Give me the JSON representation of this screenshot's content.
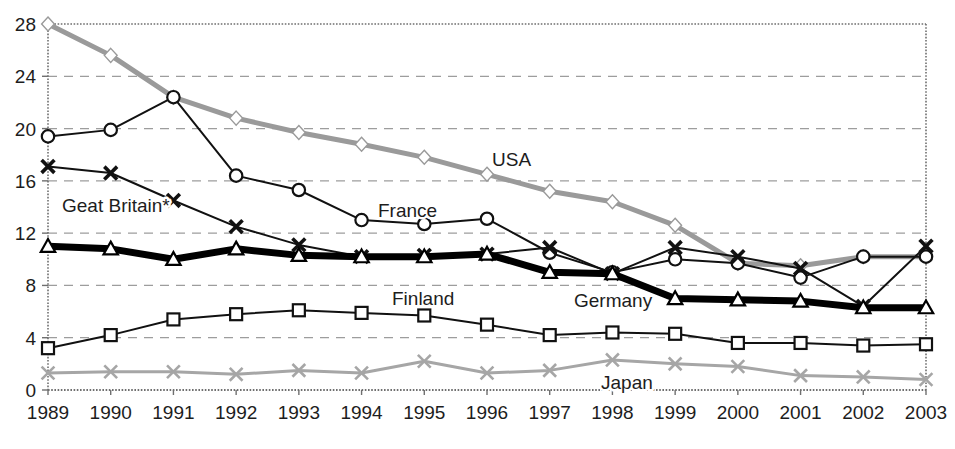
{
  "chart_data": {
    "type": "line",
    "title": "",
    "subtitle": "",
    "xlabel": "",
    "ylabel": "",
    "x": [
      1989,
      1990,
      1991,
      1992,
      1993,
      1994,
      1995,
      1996,
      1997,
      1998,
      1999,
      2000,
      2001,
      2002,
      2003
    ],
    "xtick_labels": [
      "1989",
      "1990",
      "1991",
      "1992",
      "1993",
      "1994",
      "1995",
      "1996",
      "1997",
      "1998",
      "1999",
      "2000",
      "2001",
      "2002",
      "2003"
    ],
    "ytick_labels": [
      "0",
      "4",
      "8",
      "12",
      "16",
      "20",
      "24",
      "28"
    ],
    "yticks": [
      0,
      4,
      8,
      12,
      16,
      20,
      24,
      28
    ],
    "ylim": [
      0,
      28
    ],
    "xlim": [
      1989,
      2003
    ],
    "grid": "horizontal-dashed",
    "legend_position": "inline-annotations",
    "series": [
      {
        "name": "USA",
        "label": "USA",
        "marker": "diamond",
        "color": "#9a9a9a",
        "line_width": 5,
        "style": "thick-grey",
        "values": [
          28.0,
          25.6,
          22.4,
          20.8,
          19.7,
          18.8,
          17.8,
          16.5,
          15.2,
          14.4,
          12.6,
          9.7,
          9.5,
          10.2,
          10.2
        ]
      },
      {
        "name": "France",
        "label": "France",
        "marker": "circle",
        "color": "#111111",
        "line_width": 2,
        "style": "thin-black",
        "values": [
          19.4,
          19.9,
          22.4,
          16.4,
          15.3,
          13.0,
          12.7,
          13.1,
          10.5,
          9.0,
          10.0,
          9.7,
          8.6,
          10.2,
          10.2
        ]
      },
      {
        "name": "Geat Britain*",
        "label": "Geat Britain*",
        "marker": "cross",
        "color": "#111111",
        "line_width": 2,
        "style": "thin-black",
        "values": [
          17.1,
          16.6,
          14.5,
          12.5,
          11.1,
          10.2,
          10.3,
          10.4,
          10.9,
          8.9,
          10.9,
          10.2,
          9.3,
          6.4,
          11.0
        ]
      },
      {
        "name": "Germany",
        "label": "Germany",
        "marker": "triangle",
        "color": "#000000",
        "line_width": 7,
        "style": "extra-thick-black",
        "values": [
          11.0,
          10.8,
          10.0,
          10.8,
          10.3,
          10.2,
          10.2,
          10.4,
          9.0,
          8.9,
          7.0,
          6.9,
          6.8,
          6.3,
          6.3
        ]
      },
      {
        "name": "Finland",
        "label": "Finland",
        "marker": "square",
        "color": "#111111",
        "line_width": 2,
        "style": "thin-black",
        "values": [
          3.2,
          4.2,
          5.4,
          5.8,
          6.1,
          5.9,
          5.7,
          5.0,
          4.2,
          4.4,
          4.3,
          3.6,
          3.6,
          3.4,
          3.5
        ]
      },
      {
        "name": "Japan",
        "label": "Japan",
        "marker": "cross",
        "color": "#a6a6a6",
        "line_width": 3,
        "style": "thick-grey-thin",
        "values": [
          1.3,
          1.4,
          1.4,
          1.2,
          1.5,
          1.3,
          2.2,
          1.3,
          1.5,
          2.3,
          2.0,
          1.8,
          1.1,
          1.0,
          0.8
        ]
      }
    ],
    "annotations": [
      {
        "text": "USA",
        "x_px": 492,
        "y_px": 166,
        "for_series": "USA"
      },
      {
        "text": "France",
        "x_px": 378,
        "y_px": 217,
        "for_series": "France"
      },
      {
        "text": "Geat Britain*",
        "x_px": 62,
        "y_px": 212,
        "for_series": "Geat Britain*"
      },
      {
        "text": "Germany",
        "x_px": 574,
        "y_px": 307,
        "for_series": "Germany"
      },
      {
        "text": "Finland",
        "x_px": 392,
        "y_px": 305,
        "for_series": "Finland"
      },
      {
        "text": "Japan",
        "x_px": 601,
        "y_px": 389,
        "for_series": "Japan"
      }
    ]
  },
  "colors": {
    "background": "#ffffff",
    "axis": "#6f6f6f",
    "gridline": "#9d9d9d",
    "text": "#1d1d1d",
    "usa_grey": "#9a9a9a",
    "japan_grey": "#a6a6a6",
    "black": "#000000"
  }
}
